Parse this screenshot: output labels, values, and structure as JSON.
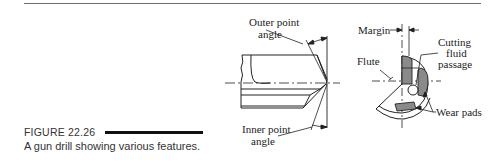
{
  "figure": {
    "number": "FIGURE 22.26",
    "caption": "A gun drill showing various features."
  },
  "side_view": {
    "labels": {
      "outer_point_angle_line1": "Outer point",
      "outer_point_angle_line2": "angle",
      "inner_point_angle_line1": "Inner point",
      "inner_point_angle_line2": "angle"
    }
  },
  "end_view": {
    "labels": {
      "margin": "Margin",
      "flute": "Flute",
      "cutting_fluid_line1": "Cutting",
      "cutting_fluid_line2": "fluid",
      "cutting_fluid_line3": "passage",
      "wear_pads": "Wear pads"
    }
  },
  "colors": {
    "line": "#222222",
    "hatch_fill": "#8a8a8a",
    "rule": "#6e6e6e"
  }
}
